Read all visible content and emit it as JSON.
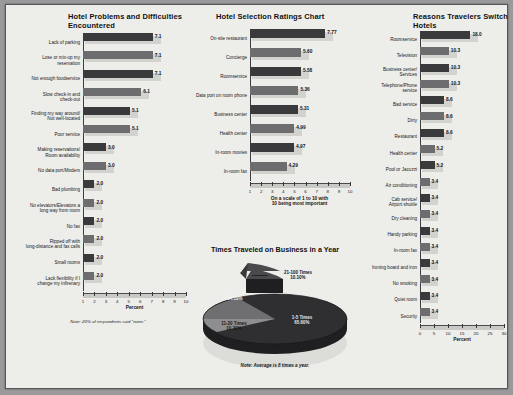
{
  "page": {
    "background": "#9a9a9a",
    "sheet_background": "#ededea"
  },
  "chart_data": [
    {
      "id": "hotel-problems",
      "type": "bar",
      "orientation": "horizontal",
      "title": "Hotel Problems and\nDifficulties Encountered",
      "xlabel": "Percent",
      "ylabel": "",
      "xlim": [
        1,
        10
      ],
      "ticks": [
        1,
        2,
        3,
        4,
        5,
        6,
        7,
        8,
        9,
        10
      ],
      "grid": false,
      "note": "Note: 20% of respondents said \"none.\"",
      "categories": [
        "Lack of parking",
        "Lose or mix-up my\nreservation",
        "Not enough foodservice",
        "Slow check-in and\ncheck-out",
        "Finding my way around/\nNot well-located",
        "Poor service",
        "Making reservations/\nRoom availability",
        "No data port/Modem",
        "Bad plumbing",
        "No elevators/Elevators a\nlong way from room",
        "No fax",
        "Ripped off with\nlong-distance and fax calls",
        "Small rooms",
        "Lack flexibility if I\nchange my infirenary"
      ],
      "values": [
        7.1,
        7.1,
        7.1,
        6.1,
        5.1,
        5.1,
        3.0,
        3.0,
        2.0,
        2.0,
        2.0,
        2.0,
        2.0,
        2.0
      ],
      "value_labels": [
        "7.1",
        "7.1",
        "7.1",
        "6.1",
        "5.1",
        "5.1",
        "3.0",
        "3.0",
        "2.0",
        "2.0",
        "2.0",
        "2.0",
        "2.0",
        "2.0"
      ]
    },
    {
      "id": "hotel-selection-ratings",
      "type": "bar",
      "orientation": "horizontal",
      "title": "Hotel Selection Ratings Chart",
      "xlabel": "On a scale of 1 to 10 with\n10 being most important",
      "ylabel": "",
      "xlim": [
        1,
        10
      ],
      "ticks": [
        1,
        2,
        3,
        4,
        5,
        6,
        7,
        8,
        9,
        10
      ],
      "grid": false,
      "note": "",
      "categories": [
        "On-site restaurant",
        "Concierge",
        "Roomservice",
        "Data port on room phone",
        "Business center",
        "Health center",
        "In-room movies",
        "In-room fax"
      ],
      "values": [
        7.77,
        5.6,
        5.58,
        5.36,
        5.31,
        4.99,
        4.97,
        4.29
      ],
      "value_labels": [
        "7.77",
        "5.60",
        "5.58",
        "5.36",
        "5.31",
        "4.99",
        "4.97",
        "4.29"
      ]
    },
    {
      "id": "reasons-switch-hotels",
      "type": "bar",
      "orientation": "horizontal",
      "title": "Reasons Travelers\nSwitch Hotels",
      "xlabel": "Percent",
      "ylabel": "",
      "xlim": [
        0,
        30
      ],
      "ticks": [
        0,
        5,
        10,
        15,
        20,
        25,
        30
      ],
      "grid": false,
      "note": "",
      "categories": [
        "Roomservice",
        "Television",
        "Business center/\nServices",
        "Telephone/Phone\nservice",
        "Bad service",
        "Dirty",
        "Restaurant",
        "Health center",
        "Pool or Jacuzzi",
        "Air conditioning",
        "Cab service/\nAirport shuttle",
        "Dry cleaning",
        "Handy parking",
        "In-room fax",
        "Ironing board and iron",
        "No smoking",
        "Quiet room",
        "Security"
      ],
      "values": [
        18.0,
        10.3,
        10.3,
        10.3,
        8.6,
        8.6,
        8.6,
        5.2,
        5.2,
        3.4,
        3.4,
        3.4,
        3.4,
        3.4,
        3.4,
        3.4,
        3.4,
        3.4
      ],
      "value_labels": [
        "18.0",
        "10.3",
        "10.3",
        "10.3",
        "8.6",
        "8.6",
        "8.6",
        "5.2",
        "5.2",
        "3.4",
        "3.4",
        "3.4",
        "3.4",
        "3.4",
        "3.4",
        "3.4",
        "3.4",
        "3.4"
      ]
    },
    {
      "id": "times-traveled-pie",
      "type": "pie",
      "title": "Times Traveled on Business in a Year",
      "note": "Note: Average is 8 times a year.",
      "labels": [
        "1-5 Times",
        "6-10 Times",
        "11-20 Times",
        "21-100 Times"
      ],
      "values": [
        65.6,
        14.1,
        10.2,
        10.1
      ],
      "value_labels": [
        "65.60%",
        "14.10%",
        "10.20%",
        "10.10%"
      ],
      "colors": [
        "#2f2f31",
        "#6f6f71",
        "#8e8e90",
        "#4a4a4c"
      ],
      "legend_position": "labels-on-slices"
    }
  ]
}
